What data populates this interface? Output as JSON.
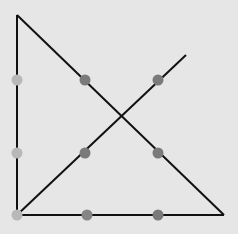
{
  "diagram": {
    "background": "#e6e6e6",
    "line_color": "#111111",
    "dots": [
      {
        "x": 17,
        "y": 80,
        "color": "#b8b8b8"
      },
      {
        "x": 85,
        "y": 80,
        "color": "#7a7a7a"
      },
      {
        "x": 158,
        "y": 80,
        "color": "#7a7a7a"
      },
      {
        "x": 17,
        "y": 153,
        "color": "#b8b8b8"
      },
      {
        "x": 85,
        "y": 153,
        "color": "#7a7a7a"
      },
      {
        "x": 158,
        "y": 153,
        "color": "#7a7a7a"
      },
      {
        "x": 17,
        "y": 215,
        "color": "#b8b8b8"
      },
      {
        "x": 87,
        "y": 215,
        "color": "#858585"
      },
      {
        "x": 158,
        "y": 215,
        "color": "#7a7a7a"
      }
    ],
    "lines": [
      {
        "x1": 17,
        "y1": 15,
        "x2": 17,
        "y2": 215
      },
      {
        "x1": 17,
        "y1": 15,
        "x2": 224,
        "y2": 215
      },
      {
        "x1": 17,
        "y1": 215,
        "x2": 224,
        "y2": 215
      },
      {
        "x1": 17,
        "y1": 215,
        "x2": 186,
        "y2": 55
      }
    ]
  }
}
